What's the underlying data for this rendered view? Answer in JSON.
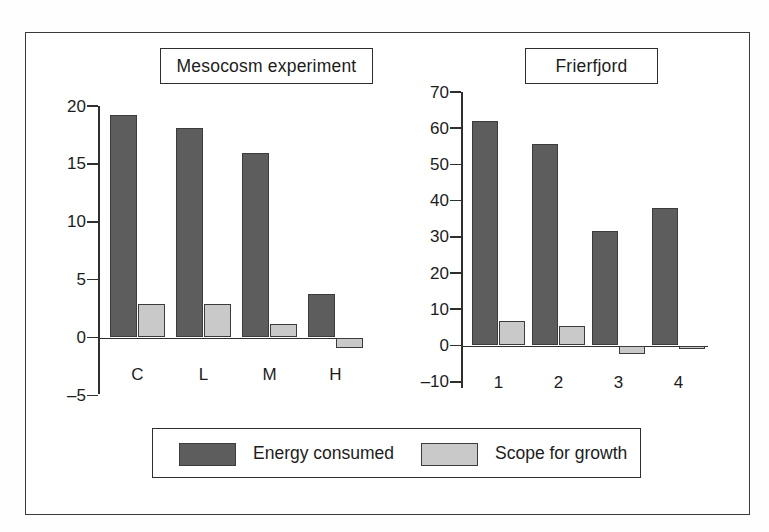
{
  "figure": {
    "background": "#ffffff",
    "frame_color": "#3a3a3a"
  },
  "colors": {
    "energy_consumed": "#5d5d5d",
    "scope_for_growth": "#c9c9c9",
    "axis": "#2f2f2f",
    "text": "#1c1c1c"
  },
  "legend": {
    "position": "bottom-center",
    "entries": [
      {
        "label": "Energy consumed",
        "color": "#5d5d5d"
      },
      {
        "label": "Scope for growth",
        "color": "#c9c9c9"
      }
    ]
  },
  "panels": [
    {
      "title": "Mesocosm experiment",
      "categories": [
        "C",
        "L",
        "M",
        "H"
      ],
      "ytick_labels": [
        "20",
        "15",
        "10",
        "5",
        "0",
        "–5"
      ],
      "ytick_values": [
        20,
        15,
        10,
        5,
        0,
        -5
      ]
    },
    {
      "title": "Frierfjord",
      "categories": [
        "1",
        "2",
        "3",
        "4"
      ],
      "ytick_labels": [
        "70",
        "60",
        "50",
        "40",
        "30",
        "20",
        "10",
        "0",
        "–10"
      ],
      "ytick_values": [
        70,
        60,
        50,
        40,
        30,
        20,
        10,
        0,
        -10
      ]
    }
  ],
  "chart_data": [
    {
      "type": "bar",
      "title": "Mesocosm experiment",
      "xlabel": "",
      "ylabel": "",
      "categories": [
        "C",
        "L",
        "M",
        "H"
      ],
      "series": [
        {
          "name": "Energy consumed",
          "values": [
            19.2,
            18.1,
            15.9,
            3.8
          ]
        },
        {
          "name": "Scope for growth",
          "values": [
            2.9,
            2.9,
            1.2,
            -0.9
          ]
        }
      ],
      "ylim": [
        -5,
        20
      ],
      "yticks": [
        -5,
        0,
        5,
        10,
        15,
        20
      ],
      "grid": false,
      "legend": "bottom"
    },
    {
      "type": "bar",
      "title": "Frierfjord",
      "xlabel": "",
      "ylabel": "",
      "categories": [
        "1",
        "2",
        "3",
        "4"
      ],
      "series": [
        {
          "name": "Energy consumed",
          "values": [
            62.0,
            55.6,
            31.6,
            38.0
          ]
        },
        {
          "name": "Scope for growth",
          "values": [
            6.8,
            5.5,
            -2.4,
            -1.0
          ]
        }
      ],
      "ylim": [
        -10,
        70
      ],
      "yticks": [
        -10,
        0,
        10,
        20,
        30,
        40,
        50,
        60,
        70
      ],
      "grid": false,
      "legend": "bottom"
    }
  ]
}
